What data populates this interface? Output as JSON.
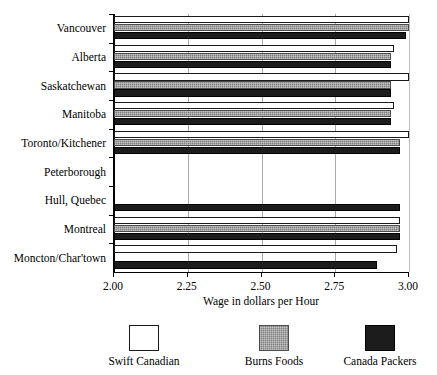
{
  "chart_data": {
    "type": "bar",
    "orientation": "horizontal",
    "title": "",
    "xlabel": "Wage in dollars per Hour",
    "ylabel": "",
    "xlim": [
      2.0,
      3.0
    ],
    "xticks": [
      "2.00",
      "2.25",
      "2.50",
      "2.75",
      "3.00"
    ],
    "xtick_values": [
      2.0,
      2.25,
      2.5,
      2.75,
      3.0
    ],
    "grid": "vertical",
    "legend_position": "bottom",
    "categories": [
      "Vancouver",
      "Alberta",
      "Saskatchewan",
      "Manitoba",
      "Toronto/Kitchener",
      "Peterborough",
      "Hull, Quebec",
      "Montreal",
      "Moncton/Char'town"
    ],
    "series": [
      {
        "name": "Swift Canadian",
        "color": "#ffffff",
        "values": [
          3.0,
          2.95,
          3.0,
          2.95,
          3.0,
          null,
          null,
          2.97,
          2.96
        ]
      },
      {
        "name": "Burns Foods",
        "color": "#808080",
        "values": [
          3.0,
          2.94,
          2.94,
          2.94,
          2.97,
          null,
          null,
          2.97,
          null
        ]
      },
      {
        "name": "Canada Packers",
        "color": "#1c1c1c",
        "values": [
          2.99,
          2.94,
          2.94,
          2.94,
          2.97,
          null,
          2.97,
          2.97,
          2.89
        ]
      }
    ]
  },
  "legend": {
    "items": [
      {
        "label": "Swift Canadian",
        "swatch": "swatch-white"
      },
      {
        "label": "Burns Foods",
        "swatch": "swatch-gray-hatched"
      },
      {
        "label": "Canada Packers",
        "swatch": "swatch-black"
      }
    ]
  }
}
